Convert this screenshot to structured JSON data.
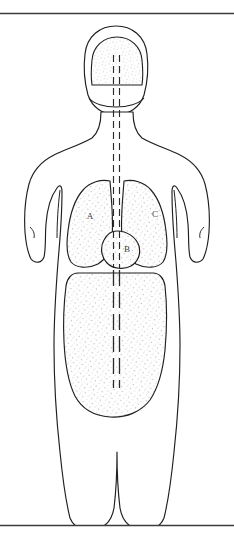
{
  "figure": {
    "background_color": "#ffffff",
    "outline_color": "#1f1f1f",
    "stipple_color": "#8c8c8c",
    "label_color": "#3a3a3a",
    "rule_color": "#3c3c3c"
  },
  "rules": {
    "top": {
      "name": "top-rule",
      "y": 13,
      "x_start": 0,
      "x_end": 234
    },
    "bottom": {
      "name": "bottom-rule",
      "y": 525,
      "x_start": 0,
      "x_end": 234
    }
  },
  "midline": {
    "name": "dashed-midline-axis",
    "style": "double dashed vertical line",
    "left_x": 113,
    "right_x": 119,
    "y_start": 55,
    "y_end": 388
  },
  "regions": [
    {
      "id": "brain",
      "label": "",
      "data_name": "brain-region",
      "shaded": true,
      "label_x": 117,
      "label_y": 60
    },
    {
      "id": "lung-left",
      "label": "A",
      "data_name": "lung-left-region",
      "shaded": true,
      "label_x": 90,
      "label_y": 217
    },
    {
      "id": "heart",
      "label": "B",
      "data_name": "heart-region",
      "shaded": true,
      "label_x": 127,
      "label_y": 249
    },
    {
      "id": "lung-right",
      "label": "C",
      "data_name": "lung-right-region",
      "shaded": true,
      "label_x": 155,
      "label_y": 215
    },
    {
      "id": "abdomen",
      "label": "",
      "data_name": "abdomen-region",
      "shaded": true,
      "label_x": 117,
      "label_y": 330
    }
  ],
  "labels": {
    "a": "A",
    "b": "B",
    "c": "C"
  }
}
